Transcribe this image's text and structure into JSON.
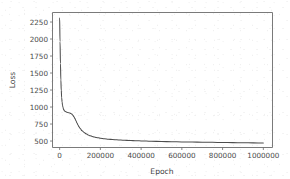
{
  "figure": {
    "background_color": "#ffffff",
    "line_color": "#4d4d4d",
    "axis_color": "#6b6b6b",
    "text_color": "#4a4a4a"
  },
  "chart_data": {
    "type": "line",
    "title": "",
    "xlabel": "Epoch",
    "ylabel": "Loss",
    "xlim": [
      -35000,
      1045000
    ],
    "ylim": [
      405,
      2390
    ],
    "grid": false,
    "legend": null,
    "xticks": [
      0,
      200000,
      400000,
      600000,
      800000,
      1000000
    ],
    "xtick_labels": [
      "0",
      "200000",
      "400000",
      "600000",
      "800000",
      "1000000"
    ],
    "yticks": [
      500,
      750,
      1000,
      1250,
      1500,
      1750,
      2000,
      2250
    ],
    "ytick_labels": [
      "500",
      "750",
      "1000",
      "1250",
      "1500",
      "1750",
      "2000",
      "2250"
    ],
    "series": [
      {
        "name": "loss",
        "x": [
          0,
          2000,
          4000,
          6000,
          8000,
          10000,
          12000,
          14000,
          16000,
          18000,
          20000,
          24000,
          28000,
          32000,
          36000,
          40000,
          45000,
          50000,
          55000,
          60000,
          65000,
          70000,
          75000,
          80000,
          85000,
          90000,
          95000,
          100000,
          110000,
          120000,
          130000,
          140000,
          150000,
          160000,
          170000,
          180000,
          190000,
          200000,
          220000,
          240000,
          260000,
          280000,
          300000,
          320000,
          340000,
          360000,
          380000,
          400000,
          450000,
          500000,
          550000,
          600000,
          650000,
          700000,
          750000,
          800000,
          850000,
          900000,
          950000,
          1000000
        ],
        "y": [
          2310,
          1960,
          1640,
          1400,
          1245,
          1140,
          1075,
          1030,
          1000,
          978,
          962,
          944,
          934,
          928,
          924,
          920,
          916,
          912,
          906,
          896,
          880,
          858,
          830,
          798,
          766,
          736,
          710,
          688,
          652,
          626,
          606,
          590,
          578,
          568,
          560,
          553,
          547,
          542,
          533,
          527,
          522,
          518,
          514,
          511,
          508,
          506,
          504,
          502,
          497,
          493,
          490,
          487,
          485,
          483,
          481,
          479,
          477,
          475,
          473,
          471
        ]
      }
    ],
    "annotations": {
      "shoulder_note": "small plateau near 900-950 between epochs ~15000 and ~55000",
      "start_value": 2310,
      "final_value": 471
    }
  }
}
